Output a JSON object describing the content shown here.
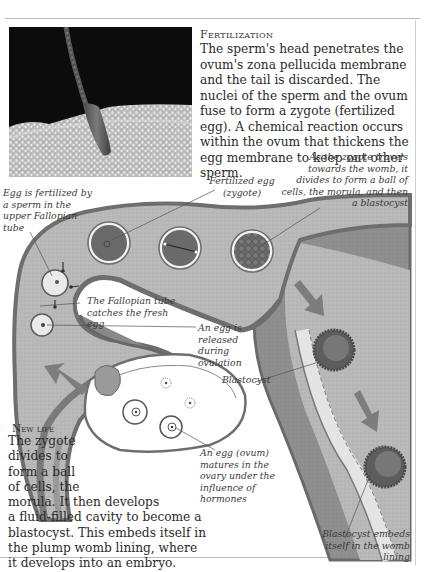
{
  "fertilization": {
    "heading": "Fertilization",
    "body": "The sperm's head penetrates the ovum's zona pellucida membrane and the tail is discarded. The nuclei of the sperm and the ovum fuse to form a zygote (fertilized egg). A chemical reaction occurs within the ovum that thickens the egg membrane to keep out other sperm."
  },
  "photo": {
    "subject": "sperm-penetrating-ovum-micrograph"
  },
  "labels": {
    "egg_fertilized": "Egg is fertilized by a sperm in the upper Fallopian tube",
    "fertilized_egg": "Fertilized egg (zygote)",
    "zygote_travels": "As the zygote travels towards the womb, it divides to form a ball of cells, the morula, and then a blastocyst",
    "tube_catches": "The Fallopian tube catches the fresh egg",
    "egg_released": "An egg is released during ovulation",
    "blastocyst": "Blastocyst",
    "egg_matures": "An egg (ovum) matures in the ovary under the influence of hormones",
    "blastocyst_embeds": "Blastocyst embeds itself in the womb lining"
  },
  "new_life": {
    "heading": "New life",
    "lines": [
      "The zygote",
      "divides to",
      "form a ball",
      "of cells, the",
      "morula. It then develops",
      "a fluid-filled cavity to become a",
      "blastocyst. This embeds itself in",
      "the plump womb lining, where",
      "it develops into an embryo."
    ]
  },
  "colors": {
    "tube_fill": "#b4b4b4",
    "tube_wall": "#6e6e6e",
    "cell_dark": "#5a5a5a",
    "arrow": "#7d7d7d",
    "uterus_wall": "#8a8a8a"
  }
}
